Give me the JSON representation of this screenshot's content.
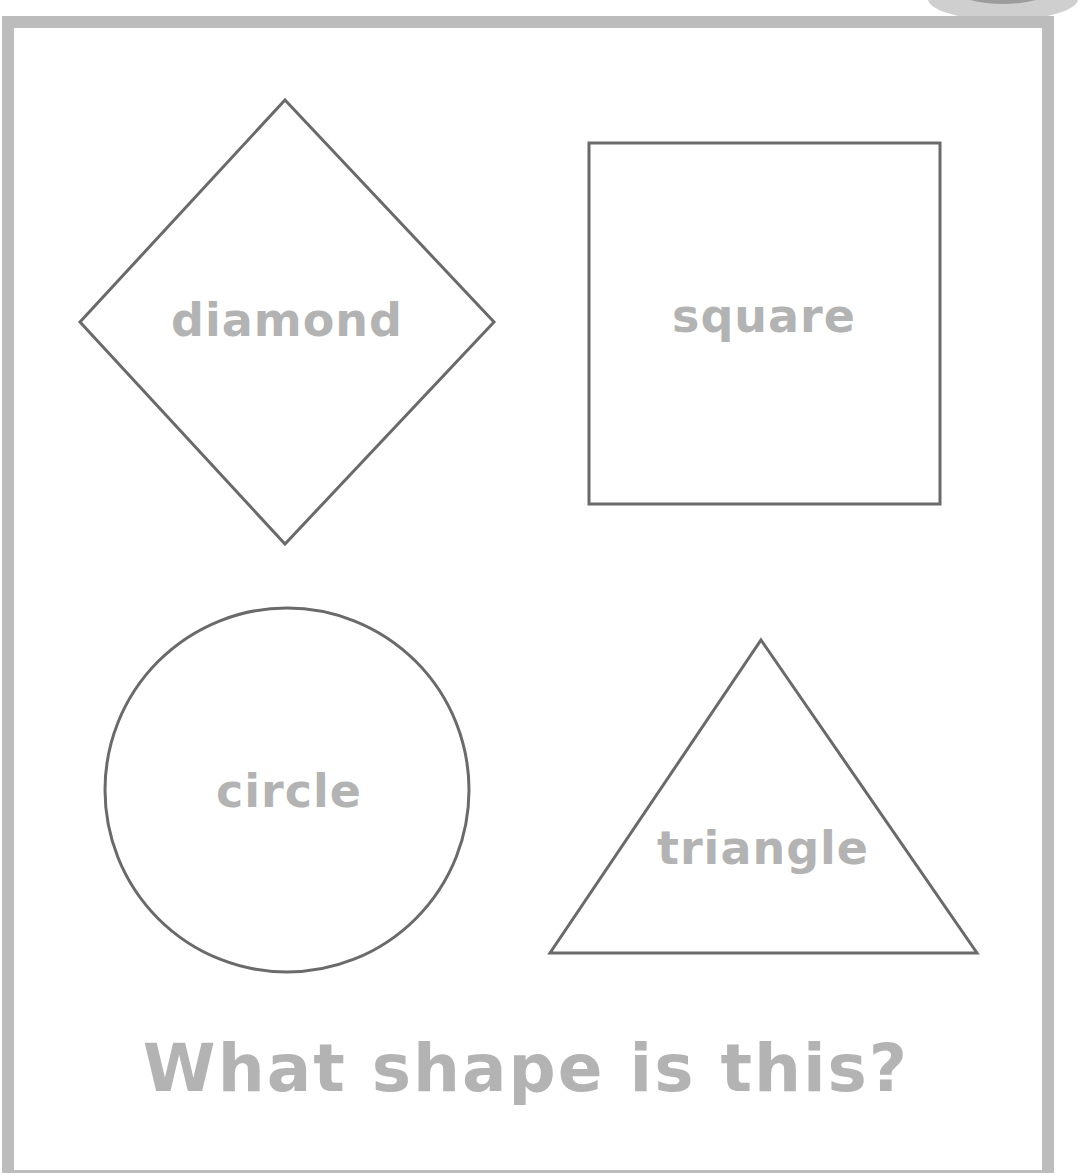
{
  "worksheet": {
    "question": "What shape is this?",
    "shapes": [
      {
        "name": "diamond",
        "label": "diamond"
      },
      {
        "name": "square",
        "label": "square"
      },
      {
        "name": "circle",
        "label": "circle"
      },
      {
        "name": "triangle",
        "label": "triangle"
      }
    ]
  },
  "colors": {
    "frame": "#bcbcbc",
    "outline": "#6a6a6a",
    "label_text": "#b3b3b3",
    "background": "#ffffff"
  }
}
